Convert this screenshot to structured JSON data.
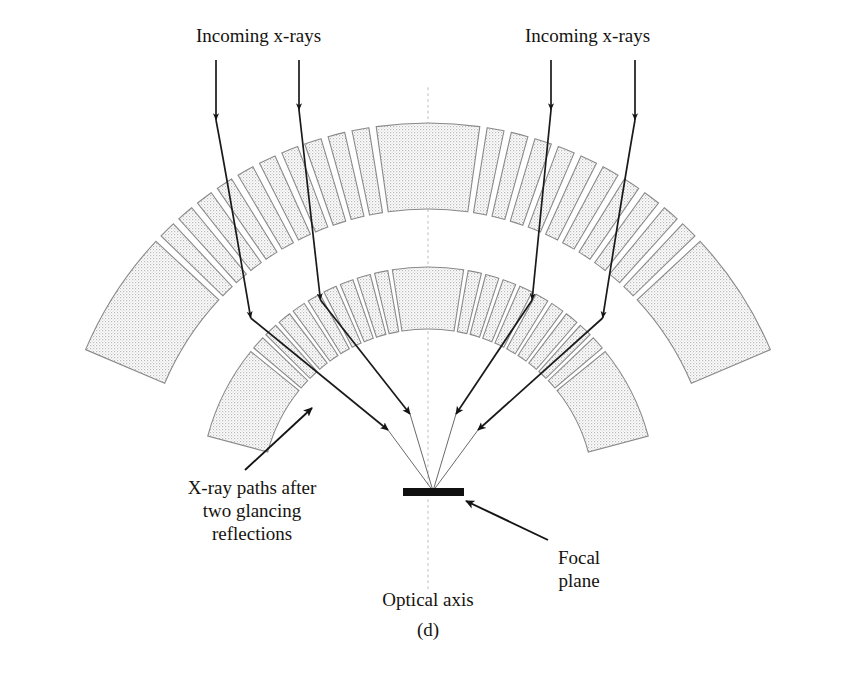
{
  "figure": {
    "panel_label": "(d)",
    "labels": {
      "incoming_left": "Incoming x-rays",
      "incoming_right": "Incoming x-rays",
      "xray_paths": "X-ray paths after\ntwo glancing\nreflections",
      "focal_plane": "Focal\nplane",
      "optical_axis": "Optical axis"
    },
    "colors": {
      "ink": "#15130f",
      "mirror_fill": "#dcdcdc",
      "mirror_stroke": "#8a8a8a",
      "ray": "#1a1a1a",
      "axis": "#cfc9c2",
      "focal_bar": "#101010",
      "background": "#ffffff"
    },
    "geometry": {
      "focus_x": 433,
      "focus_y": 491,
      "optical_axis_x": 428,
      "optical_axis_y_top": 88,
      "optical_axis_y_bottom": 592,
      "focal_bar_x1": 403,
      "focal_bar_x2": 464,
      "focal_bar_y": 492,
      "focal_bar_thickness": 8,
      "upper_arc_radius": 372,
      "lower_arc_radius": 228,
      "arc_center_x": 428,
      "arc_center_y": 495,
      "upper_arc_segments": 22,
      "lower_arc_segments": 20
    },
    "rays": [
      {
        "name": "ray-outer-left",
        "entry_x": 216,
        "hit_upper_y": 120,
        "hit_lower_y": 318,
        "arrow_focus_x": 388,
        "arrow_focus_y": 430
      },
      {
        "name": "ray-inner-left",
        "entry_x": 299,
        "hit_upper_y": 110,
        "hit_lower_y": 300,
        "arrow_focus_x": 410,
        "arrow_focus_y": 414
      },
      {
        "name": "ray-inner-right",
        "entry_x": 551,
        "hit_upper_y": 110,
        "hit_lower_y": 300,
        "arrow_focus_x": 456,
        "arrow_focus_y": 414
      },
      {
        "name": "ray-outer-right",
        "entry_x": 635,
        "hit_upper_y": 120,
        "hit_lower_y": 318,
        "arrow_focus_x": 478,
        "arrow_focus_y": 430
      }
    ],
    "leader_lines": [
      {
        "name": "leader-xray-paths",
        "x1": 245,
        "y1": 470,
        "x2": 312,
        "y2": 408
      },
      {
        "name": "leader-focal-plane",
        "x1": 548,
        "y1": 540,
        "x2": 464,
        "y2": 500
      }
    ]
  }
}
